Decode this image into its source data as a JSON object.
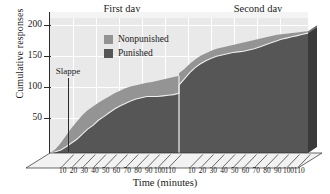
{
  "chart_data": {
    "type": "area",
    "title": "",
    "xlabel": "Time (minutes)",
    "ylabel": "Cumulative responses",
    "xlim": [
      0,
      240
    ],
    "ylim": [
      0,
      215
    ],
    "grid": true,
    "stacked": true,
    "legend_position": "top-center-left",
    "panels": [
      {
        "label": "First day",
        "x_start": 0,
        "x_end": 120
      },
      {
        "label": "Second day",
        "x_start": 120,
        "x_end": 240
      }
    ],
    "y_ticks": [
      50,
      100,
      150,
      200
    ],
    "x_ticks_day1": [
      10,
      20,
      30,
      40,
      50,
      60,
      70,
      80,
      90,
      100,
      110
    ],
    "x_ticks_day2": [
      10,
      20,
      30,
      40,
      50,
      60,
      70,
      80,
      90,
      100,
      110
    ],
    "annotations": [
      {
        "text": "Slappe",
        "x": 25,
        "y_top": 133,
        "y_bottom": 8
      }
    ],
    "series": [
      {
        "name": "Punished",
        "color": "#565656",
        "side_color": "#3a3a3a",
        "points": [
          [
            0,
            0
          ],
          [
            5,
            2
          ],
          [
            10,
            5
          ],
          [
            15,
            10
          ],
          [
            20,
            16
          ],
          [
            25,
            22
          ],
          [
            30,
            30
          ],
          [
            35,
            38
          ],
          [
            40,
            44
          ],
          [
            45,
            52
          ],
          [
            50,
            58
          ],
          [
            55,
            64
          ],
          [
            60,
            70
          ],
          [
            65,
            75
          ],
          [
            70,
            79
          ],
          [
            75,
            83
          ],
          [
            80,
            86
          ],
          [
            85,
            88
          ],
          [
            90,
            90
          ],
          [
            95,
            90
          ],
          [
            100,
            90
          ],
          [
            105,
            91
          ],
          [
            110,
            92
          ],
          [
            115,
            93
          ],
          [
            120,
            95
          ],
          [
            120,
            108
          ],
          [
            125,
            118
          ],
          [
            130,
            128
          ],
          [
            135,
            136
          ],
          [
            140,
            142
          ],
          [
            145,
            147
          ],
          [
            150,
            151
          ],
          [
            155,
            154
          ],
          [
            160,
            156
          ],
          [
            165,
            158
          ],
          [
            170,
            160
          ],
          [
            175,
            161
          ],
          [
            180,
            162
          ],
          [
            185,
            164
          ],
          [
            190,
            166
          ],
          [
            195,
            169
          ],
          [
            200,
            172
          ],
          [
            205,
            175
          ],
          [
            210,
            178
          ],
          [
            215,
            181
          ],
          [
            220,
            183
          ],
          [
            225,
            185
          ],
          [
            230,
            187
          ],
          [
            235,
            189
          ],
          [
            240,
            191
          ]
        ]
      },
      {
        "name": "Nonpunished",
        "color": "#949494",
        "side_color": "#6d6d6d",
        "points": [
          [
            0,
            0
          ],
          [
            5,
            6
          ],
          [
            10,
            16
          ],
          [
            15,
            28
          ],
          [
            20,
            40
          ],
          [
            25,
            50
          ],
          [
            30,
            60
          ],
          [
            35,
            68
          ],
          [
            40,
            74
          ],
          [
            45,
            80
          ],
          [
            50,
            85
          ],
          [
            55,
            90
          ],
          [
            60,
            95
          ],
          [
            65,
            99
          ],
          [
            70,
            103
          ],
          [
            75,
            106
          ],
          [
            80,
            108
          ],
          [
            85,
            110
          ],
          [
            90,
            112
          ],
          [
            95,
            113
          ],
          [
            100,
            115
          ],
          [
            105,
            117
          ],
          [
            110,
            119
          ],
          [
            115,
            121
          ],
          [
            120,
            123
          ],
          [
            120,
            127
          ],
          [
            125,
            134
          ],
          [
            130,
            142
          ],
          [
            135,
            149
          ],
          [
            140,
            155
          ],
          [
            145,
            159
          ],
          [
            150,
            163
          ],
          [
            155,
            166
          ],
          [
            160,
            168
          ],
          [
            165,
            170
          ],
          [
            170,
            172
          ],
          [
            175,
            174
          ],
          [
            180,
            176
          ],
          [
            185,
            178
          ],
          [
            190,
            180
          ],
          [
            195,
            182
          ],
          [
            200,
            184
          ],
          [
            205,
            186
          ],
          [
            210,
            188
          ],
          [
            215,
            189
          ],
          [
            220,
            190
          ],
          [
            225,
            191
          ],
          [
            230,
            192
          ],
          [
            235,
            193
          ],
          [
            240,
            194
          ]
        ]
      }
    ]
  },
  "chart": {
    "y_axis_title": "Cumulative responses",
    "x_axis_title": "Time (minutes)",
    "panel_first_day": "First day",
    "panel_second_day": "Second day",
    "annotation_slappe": "Slappe",
    "y_ticks": [
      "200",
      "150",
      "100",
      "50"
    ],
    "x_ticks": [
      "10",
      "20",
      "30",
      "40",
      "50",
      "60",
      "70",
      "80",
      "90",
      "100",
      "110",
      "10",
      "20",
      "30",
      "40",
      "50",
      "60",
      "70",
      "80",
      "90",
      "100",
      "110"
    ],
    "legend": [
      {
        "label": "Nonpunished",
        "color": "#949494"
      },
      {
        "label": "Punished",
        "color": "#565656"
      }
    ]
  }
}
